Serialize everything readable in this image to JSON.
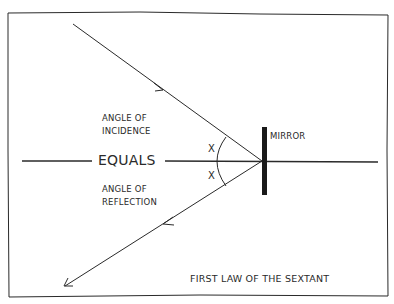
{
  "diagram": {
    "title": "FIRST LAW OF THE SEXTANT",
    "labels": {
      "incidence": [
        "ANGLE OF",
        "INCIDENCE"
      ],
      "equals": "EQUALS",
      "reflection": [
        "ANGLE OF",
        "REFLECTION"
      ],
      "mirror": "MIRROR",
      "angle_top": "X",
      "angle_bottom": "X"
    },
    "elements": [
      "incident-ray",
      "reflected-ray",
      "normal-line",
      "mirror",
      "angle-arc"
    ],
    "colors": {
      "ink": "#2a2a2a",
      "background": "#ffffff"
    }
  }
}
